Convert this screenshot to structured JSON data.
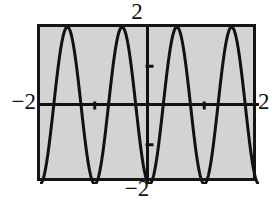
{
  "figure": {
    "kind": "graphing-calculator-plot",
    "background_color": "#ffffff",
    "plot_background_color": "#d3d3d3",
    "frame_color": "#151515",
    "curve_color": "#111111",
    "axis_color": "#111111"
  },
  "labels": {
    "top": "2",
    "bottom": "−2",
    "left": "−2",
    "right": "2"
  },
  "chart_data": {
    "type": "line",
    "title": "",
    "subtitle": "",
    "xlabel": "",
    "ylabel": "",
    "xlim": [
      -2,
      2
    ],
    "ylim": [
      -2,
      2
    ],
    "grid": false,
    "legend": null,
    "axes": {
      "x_axis_visible": true,
      "y_axis_visible": true,
      "x_ticks": [
        -1,
        1
      ],
      "y_ticks": [
        -1,
        1
      ],
      "x_tick_labels": [],
      "y_tick_labels": [],
      "x_scale_label_min": "−2",
      "x_scale_label_max": "2",
      "y_scale_label_min": "−2",
      "y_scale_label_max": "2"
    },
    "series": [
      {
        "name": "y = -2cos(2πx)",
        "expression": "-2*cos(2*pi*x)",
        "amplitude": 2,
        "period": 1,
        "phase": "trough at x = 0",
        "x": [
          -2.0,
          -1.9,
          -1.8,
          -1.7,
          -1.6,
          -1.5,
          -1.4,
          -1.3,
          -1.2,
          -1.1,
          -1.0,
          -0.9,
          -0.8,
          -0.7,
          -0.6,
          -0.5,
          -0.4,
          -0.3,
          -0.2,
          -0.1,
          0.0,
          0.1,
          0.2,
          0.3,
          0.4,
          0.5,
          0.6,
          0.7,
          0.8,
          0.9,
          1.0,
          1.1,
          1.2,
          1.3,
          1.4,
          1.5,
          1.6,
          1.7,
          1.8,
          1.9,
          2.0
        ],
        "y": [
          -2.0,
          -1.62,
          -0.62,
          0.62,
          1.62,
          2.0,
          1.62,
          0.62,
          -0.62,
          -1.62,
          -2.0,
          -1.62,
          -0.62,
          0.62,
          1.62,
          2.0,
          1.62,
          0.62,
          -0.62,
          -1.62,
          -2.0,
          -1.62,
          -0.62,
          0.62,
          1.62,
          2.0,
          1.62,
          0.62,
          -0.62,
          -1.62,
          -2.0,
          -1.62,
          -0.62,
          0.62,
          1.62,
          2.0,
          1.62,
          0.62,
          -0.62,
          -1.62,
          -2.0
        ],
        "maxima_x": [
          -1.5,
          -0.5,
          0.5,
          1.5
        ],
        "maxima_y": 2,
        "minima_x": [
          -2,
          -1,
          0,
          1,
          2
        ],
        "minima_y": -2
      }
    ]
  }
}
